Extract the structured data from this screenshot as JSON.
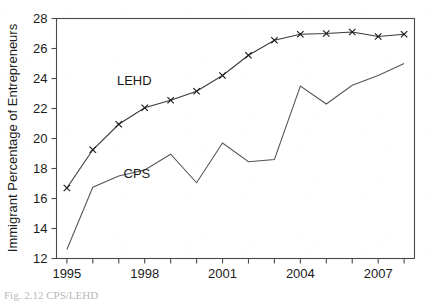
{
  "chart_data": {
    "type": "line",
    "title": "",
    "xlabel": "",
    "ylabel": "Immigrant Percentage of Entrepreneurs",
    "x": [
      1995,
      1996,
      1997,
      1998,
      1999,
      2000,
      2001,
      2002,
      2003,
      2004,
      2005,
      2006,
      2007,
      2008
    ],
    "xlim": [
      1994.6,
      2008.4
    ],
    "ylim": [
      12,
      28
    ],
    "yticks": [
      12,
      14,
      16,
      18,
      20,
      22,
      24,
      26,
      28
    ],
    "ytick_labels": [
      "12",
      "14",
      "16",
      "18",
      "20",
      "22",
      "24",
      "26",
      "28"
    ],
    "xticks": [
      1995,
      1996,
      1997,
      1998,
      1999,
      2000,
      2001,
      2002,
      2003,
      2004,
      2005,
      2006,
      2007,
      2008
    ],
    "xtick_labels_shown": [
      "1995",
      "1998",
      "2001",
      "2004",
      "2007"
    ],
    "xtick_labels_shown_values": [
      1995,
      1998,
      2001,
      2004,
      2007
    ],
    "grid": false,
    "legend": "inline-annotations",
    "series": [
      {
        "name": "LEHD",
        "marker": "x",
        "values": [
          16.7,
          19.25,
          20.95,
          22.05,
          22.55,
          23.15,
          24.2,
          25.55,
          26.55,
          26.95,
          27.0,
          27.1,
          26.8,
          26.95
        ]
      },
      {
        "name": "CPS",
        "marker": "none",
        "values": [
          12.6,
          16.75,
          17.5,
          17.9,
          18.95,
          17.05,
          19.7,
          18.45,
          18.6,
          23.5,
          22.3,
          23.55,
          24.2,
          25.0
        ]
      }
    ],
    "annotations": [
      {
        "text": "LEHD",
        "x": 1997.6,
        "y": 23.6
      },
      {
        "text": "CPS",
        "x": 1997.7,
        "y": 17.35
      }
    ]
  },
  "caption": {
    "partial_text": "Fig. 2.12   CPS/LEHD"
  }
}
